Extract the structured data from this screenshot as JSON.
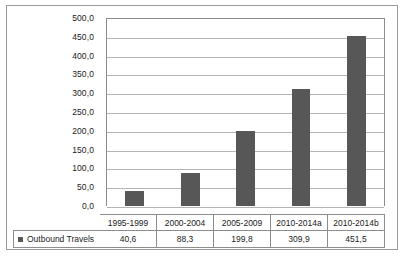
{
  "chart_data": {
    "type": "bar",
    "title": "",
    "xlabel": "",
    "ylabel": "",
    "categories": [
      "1995-1999",
      "2000-2004",
      "2005-2009",
      "2010-2014a",
      "2010-2014b"
    ],
    "series": [
      {
        "name": "Outbound Travels",
        "values": [
          40.6,
          88.3,
          199.8,
          309.9,
          451.5
        ],
        "value_labels": [
          "40,6",
          "88,3",
          "199,8",
          "309,9",
          "451,5"
        ],
        "color": "#575757"
      }
    ],
    "ylim": [
      0,
      500
    ],
    "ytick_step": 50,
    "ytick_labels": [
      "500,0",
      "450,0",
      "400,0",
      "350,0",
      "300,0",
      "250,0",
      "200,0",
      "150,0",
      "100,0",
      "50,0",
      "0,0"
    ],
    "ytick_values": [
      500,
      450,
      400,
      350,
      300,
      250,
      200,
      150,
      100,
      50,
      0
    ],
    "grid": true,
    "legend_position": "data-table-left",
    "decimal_separator": ","
  },
  "legend": {
    "label": "Outbound Travels",
    "marker": "square-marker"
  },
  "colors": {
    "bar": "#575757",
    "gridline": "#b4b4b4",
    "axis": "#8d8d8d",
    "frame": "#9a9a9a",
    "text": "#1b1b1b",
    "background": "#ffffff"
  }
}
